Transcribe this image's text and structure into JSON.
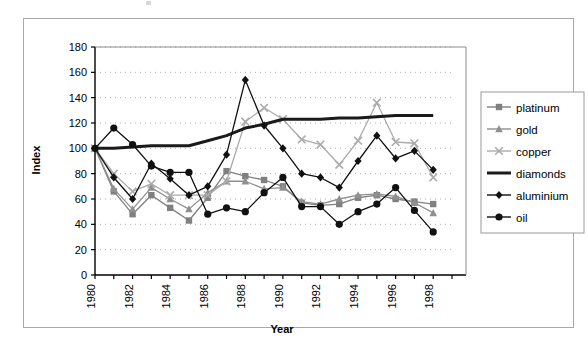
{
  "chart_data": {
    "type": "line",
    "title": "",
    "xlabel": "Year",
    "ylabel": "Index",
    "xlim": [
      1980,
      1999
    ],
    "ylim": [
      0,
      180
    ],
    "ytick_step": 20,
    "yticks": [
      0,
      20,
      40,
      60,
      80,
      100,
      120,
      140,
      160,
      180
    ],
    "xticks": [
      1980,
      1981,
      1982,
      1983,
      1984,
      1985,
      1986,
      1987,
      1988,
      1989,
      1990,
      1991,
      1992,
      1993,
      1994,
      1995,
      1996,
      1997,
      1998
    ],
    "xtick_labels": [
      "1980",
      "",
      "1982",
      "",
      "1984",
      "",
      "1986",
      "",
      "1988",
      "",
      "1990",
      "",
      "1992",
      "",
      "1994",
      "",
      "1996",
      "",
      "1998"
    ],
    "x": [
      1980,
      1981,
      1982,
      1983,
      1984,
      1985,
      1986,
      1987,
      1988,
      1989,
      1990,
      1991,
      1992,
      1993,
      1994,
      1995,
      1996,
      1997,
      1998
    ],
    "grid": "horizontal-dotted",
    "legend_position": "right",
    "series": [
      {
        "name": "platinum",
        "color": "#808080",
        "marker": "square",
        "values": [
          100,
          66,
          48,
          63,
          53,
          43,
          61,
          82,
          78,
          75,
          70,
          57,
          55,
          56,
          61,
          63,
          60,
          58,
          56
        ]
      },
      {
        "name": "gold",
        "color": "#909090",
        "marker": "triangle",
        "values": [
          100,
          68,
          52,
          69,
          60,
          52,
          65,
          74,
          74,
          68,
          69,
          58,
          56,
          60,
          63,
          64,
          62,
          57,
          49
        ]
      },
      {
        "name": "copper",
        "color": "#ababab",
        "marker": "x",
        "values": [
          100,
          80,
          66,
          72,
          63,
          63,
          63,
          74,
          121,
          132,
          123,
          107,
          103,
          87,
          106,
          136,
          105,
          104,
          77
        ]
      },
      {
        "name": "diamonds",
        "color": "#1a1a1a",
        "marker": "line",
        "values": [
          100,
          100,
          101,
          102,
          102,
          102,
          106,
          110,
          116,
          119,
          123,
          123,
          123,
          124,
          124,
          125,
          126,
          126,
          126
        ]
      },
      {
        "name": "aluminium",
        "color": "#111111",
        "marker": "diamond",
        "values": [
          100,
          77,
          60,
          88,
          76,
          63,
          70,
          95,
          154,
          118,
          100,
          80,
          77,
          69,
          90,
          110,
          92,
          98,
          83
        ]
      },
      {
        "name": "oil",
        "color": "#111111",
        "marker": "circle",
        "values": [
          100,
          116,
          103,
          86,
          81,
          81,
          48,
          53,
          50,
          65,
          77,
          54,
          54,
          40,
          50,
          56,
          69,
          51,
          34
        ]
      }
    ]
  },
  "legend": {
    "items": [
      "platinum",
      "gold",
      "copper",
      "diamonds",
      "aluminium",
      "oil"
    ]
  }
}
